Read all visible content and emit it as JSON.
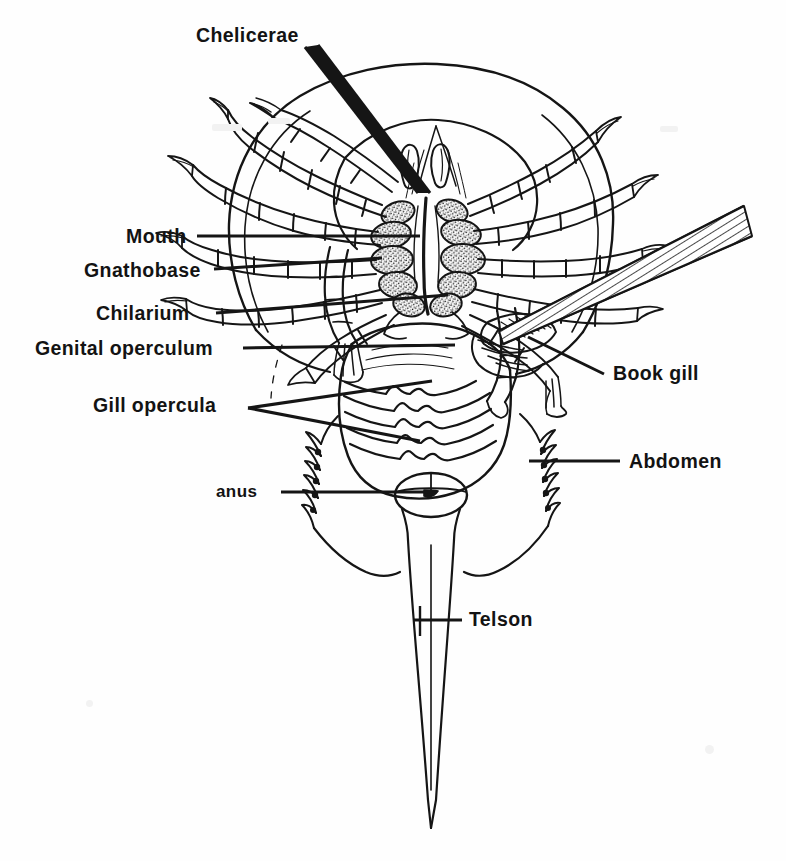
{
  "figure": {
    "view": "ventral",
    "ink_color": "#151515",
    "background_color": "#fefefe",
    "line_art": true
  },
  "labels": [
    {
      "id": "chelicerae",
      "text": "Chelicerae",
      "side": "top",
      "x": 196,
      "y": 26,
      "size": "normal"
    },
    {
      "id": "mouth",
      "text": "Mouth",
      "side": "left",
      "x": 126,
      "y": 227,
      "size": "normal"
    },
    {
      "id": "gnathobase",
      "text": "Gnathobase",
      "side": "left",
      "x": 84,
      "y": 261,
      "size": "normal"
    },
    {
      "id": "chilarium",
      "text": "Chilarium",
      "side": "left",
      "x": 96,
      "y": 304,
      "size": "normal"
    },
    {
      "id": "genital-operculum",
      "text": "Genital operculum",
      "side": "left",
      "x": 35,
      "y": 339,
      "size": "normal"
    },
    {
      "id": "gill-opercula",
      "text": "Gill  opercula",
      "side": "left",
      "x": 93,
      "y": 396,
      "size": "normal"
    },
    {
      "id": "anus",
      "text": "anus",
      "side": "left",
      "x": 216,
      "y": 483,
      "size": "small"
    },
    {
      "id": "book-gill",
      "text": "Book gill",
      "side": "right",
      "x": 613,
      "y": 364,
      "size": "normal"
    },
    {
      "id": "abdomen",
      "text": "Abdomen",
      "side": "right",
      "x": 629,
      "y": 452,
      "size": "normal"
    },
    {
      "id": "telson",
      "text": "Telson",
      "side": "right",
      "x": 469,
      "y": 610,
      "size": "normal"
    }
  ],
  "anatomy_parts": [
    {
      "name": "Chelicerae",
      "description": "First pair of small pincer-bearing appendages flanking the mouth"
    },
    {
      "name": "Mouth",
      "description": "Central opening surrounded by the gnathobases of the walking legs"
    },
    {
      "name": "Gnathobase",
      "description": "Spiny chewing base of each walking leg, stippled in the drawing"
    },
    {
      "name": "Chilarium",
      "description": "Small reduced pair of plates behind the last pair of legs"
    },
    {
      "name": "Genital operculum",
      "description": "Flap-like first abdominal appendage covering the genital pores"
    },
    {
      "name": "Gill opercula",
      "description": "Five overlapping plates bearing the book gills"
    },
    {
      "name": "Book gill",
      "description": "Stacked leaf-like respiratory lamellae on the underside of an operculum"
    },
    {
      "name": "Abdomen",
      "description": "Opisthosoma bearing movable lateral spines"
    },
    {
      "name": "Anus",
      "description": "Opening at the posterior margin of the abdomen, before the telson"
    },
    {
      "name": "Telson",
      "description": "Long spike-like tail"
    }
  ],
  "leaders": [
    {
      "label": "chelicerae",
      "count": 2
    },
    {
      "label": "mouth",
      "count": 1
    },
    {
      "label": "gnathobase",
      "count": 1
    },
    {
      "label": "chilarium",
      "count": 1
    },
    {
      "label": "genital-operculum",
      "count": 1
    },
    {
      "label": "gill-opercula",
      "count": 2
    },
    {
      "label": "anus",
      "count": 1
    },
    {
      "label": "book-gill",
      "count": 2
    },
    {
      "label": "abdomen",
      "count": 1
    },
    {
      "label": "telson",
      "count": 1
    }
  ]
}
